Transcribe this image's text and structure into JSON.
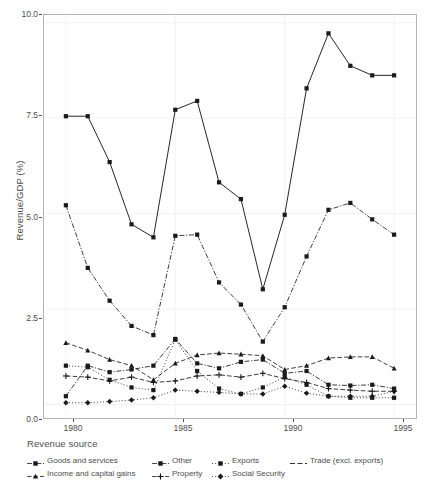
{
  "chart_data": {
    "type": "line",
    "title": "",
    "xlabel": "",
    "ylabel": "Revenue/GDP (%)",
    "xlim": [
      1979.0,
      1996.0
    ],
    "ylim": [
      -0.35,
      10.2
    ],
    "x_ticks": [
      1980,
      1985,
      1990,
      1995
    ],
    "y_ticks": [
      "0.0",
      "2.5",
      "5.0",
      "7.5",
      "10.0"
    ],
    "y_tick_values": [
      0.0,
      2.5,
      5.0,
      7.5,
      10.0
    ],
    "grid": true,
    "grid_color": "#f2f2f2",
    "panel_border_color": "#b3b3b3",
    "legend_position": "bottom",
    "legend_title": "Revenue source",
    "x": [
      1980,
      1981,
      1982,
      1983,
      1984,
      1985,
      1986,
      1987,
      1988,
      1989,
      1990,
      1991,
      1992,
      1993,
      1994,
      1995
    ],
    "series": [
      {
        "name": "Trade (excl. exports)",
        "linestyle": "solid",
        "marker": "square",
        "values": [
          7.55,
          7.55,
          6.35,
          4.72,
          4.38,
          7.72,
          7.95,
          5.82,
          5.38,
          3.02,
          4.97,
          8.28,
          9.72,
          8.87,
          8.62,
          8.62
        ]
      },
      {
        "name": "Goods and services",
        "linestyle": "dashdot",
        "marker": "square",
        "values": [
          5.22,
          3.58,
          2.72,
          2.06,
          1.82,
          4.42,
          4.45,
          3.2,
          2.62,
          1.65,
          2.55,
          3.88,
          5.1,
          5.28,
          4.85,
          4.45
        ]
      },
      {
        "name": "Income and capital gains",
        "linestyle": "dashed",
        "marker": "triangle",
        "values": [
          1.62,
          1.42,
          1.18,
          1.02,
          0.65,
          1.08,
          1.3,
          1.35,
          1.32,
          1.28,
          0.92,
          1.02,
          1.22,
          1.25,
          1.25,
          0.95
        ]
      },
      {
        "name": "Other",
        "linestyle": "dashdot",
        "marker": "square",
        "values": [
          0.22,
          1.02,
          0.85,
          0.92,
          1.02,
          1.72,
          1.08,
          0.95,
          1.12,
          1.18,
          0.82,
          0.88,
          0.52,
          0.5,
          0.52,
          0.42
        ]
      },
      {
        "name": "Property",
        "linestyle": "dashed",
        "marker": "plus",
        "values": [
          0.75,
          0.72,
          0.62,
          0.72,
          0.58,
          0.62,
          0.75,
          0.78,
          0.72,
          0.82,
          0.68,
          0.58,
          0.42,
          0.38,
          0.35,
          0.35
        ]
      },
      {
        "name": "Exports",
        "linestyle": "dotted",
        "marker": "square",
        "values": [
          1.02,
          0.98,
          0.65,
          0.45,
          0.38,
          1.7,
          0.88,
          0.42,
          0.28,
          0.45,
          0.72,
          0.52,
          0.22,
          0.18,
          0.18,
          0.18
        ]
      },
      {
        "name": "Social Security",
        "linestyle": "dotted",
        "marker": "diamond",
        "values": [
          0.05,
          0.05,
          0.08,
          0.12,
          0.18,
          0.38,
          0.35,
          0.32,
          0.28,
          0.28,
          0.48,
          0.3,
          0.22,
          0.22,
          0.22,
          0.35
        ]
      }
    ]
  },
  "axis": {
    "y_title": "Revenue/GDP (%)",
    "y_labels": [
      "10.0",
      "7.5",
      "5.0",
      "2.5",
      "0.0"
    ],
    "x_labels": [
      "1980",
      "1985",
      "1990",
      "1995"
    ]
  },
  "legend": {
    "title": "Revenue source",
    "columns": [
      {
        "items": [
          {
            "label": "Goods and services",
            "key": "dashdot-square-key"
          },
          {
            "label": "Income and capital gains",
            "key": "dashed-triangle-key"
          }
        ]
      },
      {
        "items": [
          {
            "label": "Other",
            "key": "dashdot-square-key"
          },
          {
            "label": "Property",
            "key": "dashed-plus-key"
          }
        ]
      },
      {
        "items": [
          {
            "label": "Exports",
            "key": "dotted-square-key"
          },
          {
            "label": "Social Security",
            "key": "dotted-diamond-key"
          }
        ]
      },
      {
        "items": [
          {
            "label": "Trade (excl. exports)",
            "key": "solid-line-key"
          }
        ]
      }
    ]
  },
  "caption": {
    "text": ""
  }
}
